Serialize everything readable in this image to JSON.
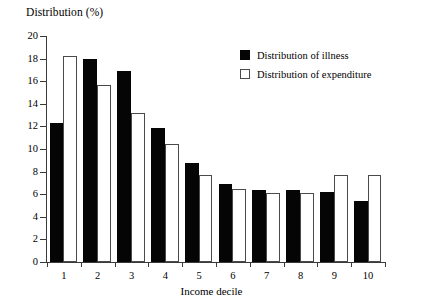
{
  "chart_data": {
    "type": "bar",
    "title": "Distribution (%)",
    "xlabel": "Income decile",
    "ylabel": "Distribution (%)",
    "categories": [
      "1",
      "2",
      "3",
      "4",
      "5",
      "6",
      "7",
      "8",
      "9",
      "10"
    ],
    "series": [
      {
        "name": "Distribution of illness",
        "color": "#050505",
        "style": "filled",
        "values": [
          12.3,
          18.0,
          16.9,
          11.9,
          8.8,
          6.9,
          6.4,
          6.4,
          6.2,
          5.4
        ]
      },
      {
        "name": "Distribution of expenditure",
        "color": "#ffffff",
        "style": "open",
        "values": [
          18.2,
          15.7,
          13.2,
          10.4,
          7.7,
          6.5,
          6.1,
          6.1,
          7.7,
          7.7
        ]
      }
    ],
    "ylim": [
      0,
      20
    ],
    "yticks": [
      0,
      2,
      4,
      6,
      8,
      10,
      12,
      14,
      16,
      18,
      20
    ],
    "ytick_labels": [
      "0",
      "2",
      "4",
      "6",
      "8",
      "10",
      "12",
      "14",
      "16",
      "18",
      "20"
    ],
    "grid": false,
    "legend_position": "top-right"
  },
  "legend": {
    "entries": [
      {
        "label": "Distribution of illness",
        "swatch": "filled-square-icon"
      },
      {
        "label": "Distribution of expenditure",
        "swatch": "open-square-icon"
      }
    ]
  },
  "axes": {
    "y_title": "Distribution (%)",
    "x_title": "Income decile"
  }
}
